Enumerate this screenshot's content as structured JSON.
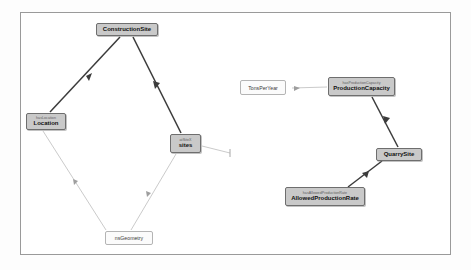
{
  "canvas": {
    "background": "#ffffff",
    "border_color": "#9a9a9a",
    "node_fill": "#c9c9c9",
    "node_border": "#6e6e6e",
    "plain_fill": "#fbfbfb",
    "plain_border": "#b4b4b4",
    "edge_dark": "#3c3c3c",
    "edge_light": "#c4c4c4"
  },
  "graph": {
    "type": "node-link-ontology",
    "nodes": [
      {
        "id": "constructionsite",
        "label": "ConstructionSite",
        "property": "",
        "style": "filled",
        "x": 96,
        "y": 23,
        "w": 62,
        "h": 13
      },
      {
        "id": "location",
        "label": "Location",
        "property": "hasLocation",
        "style": "filled",
        "x": 26,
        "y": 113,
        "w": 40,
        "h": 17
      },
      {
        "id": "sitex",
        "label": "sites",
        "property": "atSiteX",
        "style": "filled",
        "x": 170,
        "y": 134,
        "w": 31,
        "h": 19
      },
      {
        "id": "nsgeometry",
        "label": "nsGeometry",
        "property": "",
        "style": "plain",
        "x": 105,
        "y": 231,
        "w": 48,
        "h": 14
      },
      {
        "id": "tonsperyear",
        "label": "TonsPerYear",
        "property": "",
        "style": "plain",
        "x": 240,
        "y": 80,
        "w": 46,
        "h": 15
      },
      {
        "id": "productioncapacity",
        "label": "ProductionCapacity",
        "property": "hasProductionCapacity",
        "style": "filled",
        "x": 328,
        "y": 77,
        "w": 67,
        "h": 19
      },
      {
        "id": "quarrysite",
        "label": "QuarrySite",
        "property": "",
        "style": "filled",
        "x": 376,
        "y": 148,
        "w": 46,
        "h": 13
      },
      {
        "id": "allowedproductionrate",
        "label": "AllowedProductionRate",
        "property": "hasAllowedProductionRate",
        "style": "filled",
        "x": 285,
        "y": 187,
        "w": 80,
        "h": 19
      }
    ],
    "edges": [
      {
        "id": "e1",
        "from": "constructionsite",
        "to": "location",
        "weight": "thick"
      },
      {
        "id": "e2",
        "from": "constructionsite",
        "to": "sitex",
        "weight": "thick"
      },
      {
        "id": "e3",
        "from": "location",
        "to": "nsgeometry",
        "weight": "thin"
      },
      {
        "id": "e4",
        "from": "sitex",
        "to": "nsgeometry",
        "weight": "thin"
      },
      {
        "id": "e5",
        "from": "sitex",
        "to": "stub",
        "weight": "thin"
      },
      {
        "id": "e6",
        "from": "productioncapacity",
        "to": "tonsperyear",
        "weight": "thin"
      },
      {
        "id": "e7",
        "from": "productioncapacity",
        "to": "quarrysite",
        "weight": "thick"
      },
      {
        "id": "e8",
        "from": "quarrysite",
        "to": "allowedproductionrate",
        "weight": "thick"
      }
    ]
  }
}
